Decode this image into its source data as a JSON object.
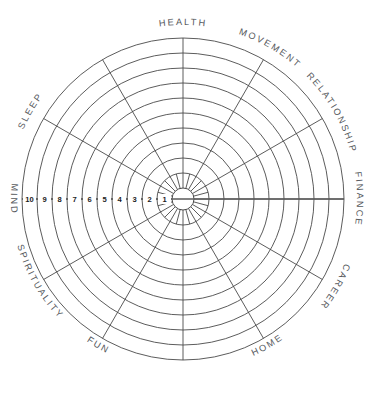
{
  "diagram": {
    "type": "radar-wheel",
    "geometry": {
      "cx": 183,
      "cy": 199,
      "outer_radius": 161,
      "hub_radius": 11,
      "ring_count": 10,
      "spoke_count": 12
    },
    "style": {
      "line_color": "#4a4a4a",
      "axis_color": "#5a5a5a",
      "label_color": "#55585c",
      "number_color": "#1c1c1c",
      "background": "#ffffff"
    },
    "sectors": [
      {
        "label": "HEALTH",
        "center_angle_deg": -90,
        "label_flip": false
      },
      {
        "label": "MOVEMENT",
        "center_angle_deg": -60,
        "label_flip": false
      },
      {
        "label": "RELATIONSHIP",
        "center_angle_deg": -30,
        "label_flip": false
      },
      {
        "label": "FINANCE",
        "center_angle_deg": 0,
        "label_flip": false
      },
      {
        "label": "CAREER",
        "center_angle_deg": 30,
        "label_flip": false
      },
      {
        "label": "HOME",
        "center_angle_deg": 60,
        "label_flip": true
      },
      {
        "label": "FUN",
        "center_angle_deg": 120,
        "label_flip": true
      },
      {
        "label": "SPIRITUALITY",
        "center_angle_deg": 150,
        "label_flip": true
      },
      {
        "label": "MIND",
        "center_angle_deg": 180,
        "label_flip": true
      },
      {
        "label": "SLEEP",
        "center_angle_deg": -150,
        "label_flip": false
      }
    ],
    "scale": {
      "axis": "left-horizontal",
      "direction": "outer-to-inner",
      "labels": [
        "10",
        "9",
        "8",
        "7",
        "6",
        "5",
        "4",
        "3",
        "2",
        "1"
      ]
    }
  }
}
